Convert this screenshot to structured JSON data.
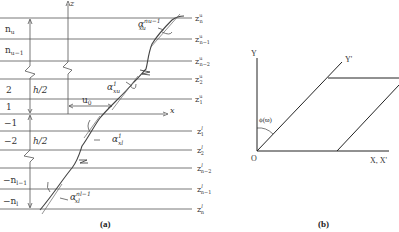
{
  "panel_a": {
    "caption": "(a)",
    "axis_z": "z",
    "axis_x": "x",
    "offset_label": "u",
    "offset_sub": "0",
    "half_thickness": "h/2",
    "upper_layers": [
      {
        "label": "n",
        "sub": "u"
      },
      {
        "label": "n",
        "sub": "u−1"
      },
      {
        "label": "2",
        "sub": ""
      },
      {
        "label": "1",
        "sub": ""
      }
    ],
    "lower_layers": [
      {
        "label": "−1",
        "sub": ""
      },
      {
        "label": "−2",
        "sub": ""
      },
      {
        "label": "−n",
        "sub": "l−1"
      },
      {
        "label": "−n",
        "sub": "l"
      }
    ],
    "interfaces_upper": [
      {
        "base": "z",
        "sup": "u",
        "sub": "n"
      },
      {
        "base": "z",
        "sup": "u",
        "sub": "n−1"
      },
      {
        "base": "z",
        "sup": "u",
        "sub": "n−2"
      },
      {
        "base": "z",
        "sup": "u",
        "sub": "2"
      },
      {
        "base": "z",
        "sup": "u",
        "sub": "1"
      }
    ],
    "interfaces_lower": [
      {
        "base": "z",
        "sup": "l",
        "sub": "1"
      },
      {
        "base": "z",
        "sup": "l",
        "sub": "2"
      },
      {
        "base": "z",
        "sup": "l",
        "sub": "n−2"
      },
      {
        "base": "z",
        "sup": "l",
        "sub": "n−1"
      },
      {
        "base": "z",
        "sup": "l",
        "sub": "n"
      }
    ],
    "angles": [
      {
        "base": "α",
        "sup": "nu−1",
        "sub": "xu"
      },
      {
        "base": "α",
        "sup": "1",
        "sub": "xu"
      },
      {
        "base": "α",
        "sup": "1",
        "sub": "xl"
      },
      {
        "base": "α",
        "sup": "nl−1",
        "sub": "xl"
      }
    ]
  },
  "panel_b": {
    "caption": "(b)",
    "axis_y": "Y",
    "axis_y_prime": "Y'",
    "axis_x": "X, X'",
    "origin": "O",
    "angle_label": "ϕ(ϖ)"
  }
}
